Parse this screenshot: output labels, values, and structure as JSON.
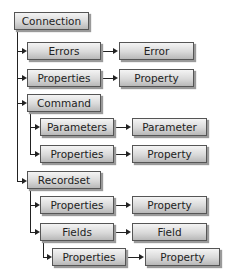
{
  "diagram": {
    "nodes": [
      {
        "id": "connection",
        "label": "Connection",
        "x": 14,
        "y": 12,
        "w": 75
      },
      {
        "id": "errors",
        "label": "Errors",
        "x": 27,
        "y": 42,
        "w": 74
      },
      {
        "id": "error",
        "label": "Error",
        "x": 119,
        "y": 42,
        "w": 75
      },
      {
        "id": "conn-properties",
        "label": "Properties",
        "x": 27,
        "y": 69,
        "w": 74
      },
      {
        "id": "conn-property",
        "label": "Property",
        "x": 119,
        "y": 69,
        "w": 75
      },
      {
        "id": "command",
        "label": "Command",
        "x": 27,
        "y": 94,
        "w": 74
      },
      {
        "id": "parameters",
        "label": "Parameters",
        "x": 40,
        "y": 118,
        "w": 74
      },
      {
        "id": "parameter",
        "label": "Parameter",
        "x": 132,
        "y": 118,
        "w": 75
      },
      {
        "id": "cmd-properties",
        "label": "Properties",
        "x": 40,
        "y": 145,
        "w": 74
      },
      {
        "id": "cmd-property",
        "label": "Property",
        "x": 132,
        "y": 145,
        "w": 75
      },
      {
        "id": "recordset",
        "label": "Recordset",
        "x": 27,
        "y": 171,
        "w": 74
      },
      {
        "id": "rs-properties",
        "label": "Properties",
        "x": 40,
        "y": 196,
        "w": 74
      },
      {
        "id": "rs-property",
        "label": "Property",
        "x": 132,
        "y": 196,
        "w": 75
      },
      {
        "id": "fields",
        "label": "Fields",
        "x": 40,
        "y": 223,
        "w": 74
      },
      {
        "id": "field",
        "label": "Field",
        "x": 132,
        "y": 223,
        "w": 75
      },
      {
        "id": "field-properties",
        "label": "Properties",
        "x": 52,
        "y": 248,
        "w": 74
      },
      {
        "id": "field-property",
        "label": "Property",
        "x": 145,
        "y": 248,
        "w": 75
      }
    ]
  }
}
